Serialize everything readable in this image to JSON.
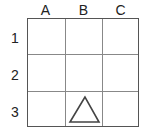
{
  "columns": [
    {
      "label": "A"
    },
    {
      "label": "B"
    },
    {
      "label": "C"
    }
  ],
  "rows": [
    {
      "label": "1"
    },
    {
      "label": "2"
    },
    {
      "label": "3"
    }
  ],
  "shapes": [
    {
      "type": "triangle",
      "column": "B",
      "row": "3",
      "fill": "none",
      "stroke": "#444444"
    }
  ],
  "colors": {
    "grid_line": "#888888",
    "border": "#555555",
    "text": "#222222"
  }
}
